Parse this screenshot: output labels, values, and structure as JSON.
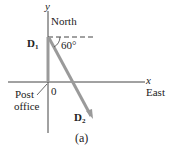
{
  "diagram": {
    "caption": "(a)",
    "axes": {
      "y_label": "y",
      "y_direction": "North",
      "x_label": "x",
      "x_direction": "East",
      "origin_label": "0",
      "origin_place_line1": "Post",
      "origin_place_line2": "office"
    },
    "vectors": [
      {
        "name": "D",
        "subscript": "1",
        "direction": "North",
        "color": "#9a9a9a"
      },
      {
        "name": "D",
        "subscript": "2",
        "angle_label": "60°",
        "color": "#9a9a9a"
      }
    ],
    "colors": {
      "axis": "#444444",
      "vector": "#9a9a9a",
      "dashed_reference": "#444444",
      "text": "#222222"
    }
  }
}
